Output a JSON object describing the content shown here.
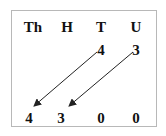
{
  "headers": [
    "Th",
    "H",
    "T",
    "U"
  ],
  "top_row": {
    "T": "4",
    "U": "3"
  },
  "bottom_row": [
    "4",
    "3",
    "0",
    "0"
  ],
  "arrows": [
    {
      "from": "T",
      "to": "Th"
    },
    {
      "from": "U",
      "to": "H"
    }
  ],
  "colors": {
    "text": "#111111",
    "border": "#b8b8b8",
    "arrow": "#222222"
  }
}
